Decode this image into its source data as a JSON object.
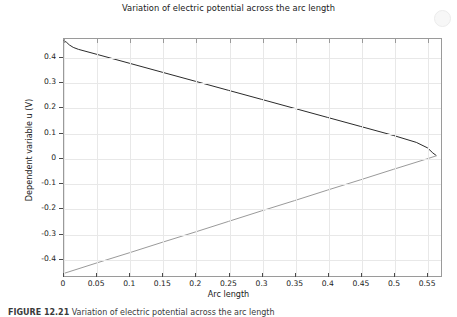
{
  "figure": {
    "title": "Variation of electric potential across the arc length",
    "caption_label": "FIGURE 12.21",
    "caption_text": "Variation of electric potential across the arc length"
  },
  "watermark": {
    "text": "",
    "badge": "watermark-badge"
  },
  "chart_data": {
    "type": "line",
    "title": "Variation of electric potential across the arc length",
    "xlabel": "Arc length",
    "ylabel": "Dependent variable u (V)",
    "xlim": [
      0,
      0.5725
    ],
    "ylim": [
      -0.4725,
      0.4755
    ],
    "xticks": [
      0,
      0.05,
      0.1,
      0.15,
      0.2,
      0.25,
      0.3,
      0.35,
      0.4,
      0.45,
      0.5,
      0.55
    ],
    "xtick_labels": [
      "0",
      "0.05",
      "0.1",
      "0.15",
      "0.2",
      "0.25",
      "0.3",
      "0.35",
      "0.4",
      "0.45",
      "0.5",
      "0.55"
    ],
    "yticks": [
      0.4,
      0.3,
      0.2,
      0.1,
      0,
      -0.1,
      -0.2,
      -0.3,
      -0.4
    ],
    "ytick_labels": [
      "0.4",
      "0.3",
      "0.2",
      "0.1",
      "0",
      "-0.1",
      "-0.2",
      "-0.3",
      "-0.4"
    ],
    "grid": true,
    "legend": "none",
    "series": [
      {
        "name": "upper-branch",
        "color": "#2b2b2b",
        "x": [
          0,
          0.004,
          0.008,
          0.014,
          0.022,
          0.05,
          0.1,
          0.15,
          0.2,
          0.25,
          0.3,
          0.35,
          0.4,
          0.45,
          0.5,
          0.535,
          0.552,
          0.56,
          0.565
        ],
        "y": [
          0.468,
          0.462,
          0.452,
          0.442,
          0.434,
          0.414,
          0.378,
          0.342,
          0.306,
          0.27,
          0.234,
          0.198,
          0.162,
          0.126,
          0.09,
          0.062,
          0.04,
          0.02,
          0.01
        ]
      },
      {
        "name": "lower-branch",
        "color": "#9a9a9a",
        "x": [
          0,
          0.05,
          0.1,
          0.15,
          0.2,
          0.25,
          0.3,
          0.35,
          0.4,
          0.45,
          0.5,
          0.55,
          0.565
        ],
        "y": [
          -0.462,
          -0.42,
          -0.379,
          -0.337,
          -0.296,
          -0.254,
          -0.212,
          -0.171,
          -0.129,
          -0.088,
          -0.046,
          -0.005,
          0.008
        ]
      }
    ]
  }
}
